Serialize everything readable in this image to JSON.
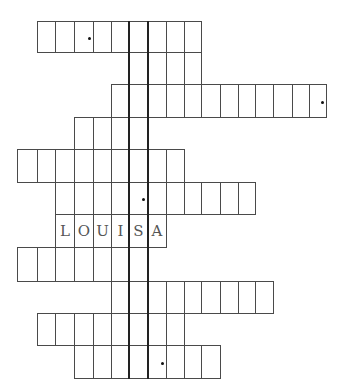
{
  "puzzle": {
    "type": "crossword-keyword",
    "col_edges": [
      17,
      37,
      55,
      74,
      93,
      111,
      129,
      147,
      166,
      184,
      201,
      220,
      238,
      255,
      273,
      292,
      309,
      326
    ],
    "row_edges": [
      21,
      52,
      84,
      117,
      149,
      182,
      214,
      247,
      281,
      313,
      345,
      378
    ],
    "key_column": {
      "x_left": 128,
      "x_right": 147,
      "y_top": 21,
      "y_bottom": 378
    },
    "rows": [
      {
        "index": 1,
        "start_col": 1,
        "length": 9,
        "letters": [],
        "dot_at": 2
      },
      {
        "index": 2,
        "start_col": 6,
        "length": 4,
        "letters": [],
        "dot_at": null
      },
      {
        "index": 3,
        "start_col": 5,
        "length": 12,
        "letters": [],
        "dot_at": 11
      },
      {
        "index": 4,
        "start_col": 3,
        "length": 4,
        "letters": [],
        "dot_at": null
      },
      {
        "index": 5,
        "start_col": 0,
        "length": 9,
        "letters": [],
        "dot_at": null
      },
      {
        "index": 6,
        "start_col": 2,
        "length": 11,
        "letters": [],
        "dot_at": 4
      },
      {
        "index": 7,
        "start_col": 2,
        "length": 6,
        "letters": [
          "L",
          "O",
          "U",
          "I",
          "S",
          "A"
        ],
        "dot_at": null
      },
      {
        "index": 8,
        "start_col": 0,
        "length": 7,
        "letters": [],
        "dot_at": null
      },
      {
        "index": 9,
        "start_col": 5,
        "length": 9,
        "letters": [],
        "dot_at": null
      },
      {
        "index": 10,
        "start_col": 1,
        "length": 8,
        "letters": [],
        "dot_at": null
      },
      {
        "index": 11,
        "start_col": 3,
        "length": 8,
        "letters": [],
        "dot_at": 4
      }
    ],
    "filled_word": "LOUISA"
  }
}
